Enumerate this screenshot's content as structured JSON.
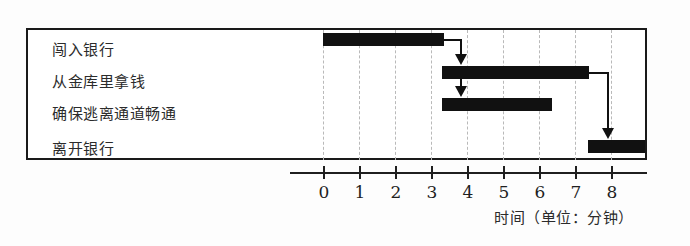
{
  "chart_data": {
    "type": "bar",
    "subtype": "gantt",
    "title": "",
    "xlabel": "时间（单位：分钟）",
    "ylabel": "",
    "xlim": [
      0,
      9
    ],
    "xticks": [
      0,
      1,
      2,
      3,
      4,
      5,
      6,
      7,
      8
    ],
    "xtick_labels": [
      "0",
      "1",
      "2",
      "3",
      "4",
      "5",
      "6",
      "7",
      "8"
    ],
    "grid": true,
    "grid_style": "dashed-vertical",
    "legend": "none",
    "bar_color": "#111111",
    "categories": [
      "闯入银行",
      "从金库里拿钱",
      "确保逃离通道畅通",
      "离开银行"
    ],
    "tasks": [
      {
        "name": "闯入银行",
        "start": 0.0,
        "end": 3.35,
        "duration": 3.35
      },
      {
        "name": "从金库里拿钱",
        "start": 3.3,
        "end": 7.4,
        "duration": 4.1
      },
      {
        "name": "确保逃离通道畅通",
        "start": 3.3,
        "end": 6.35,
        "duration": 3.05
      },
      {
        "name": "离开银行",
        "start": 7.35,
        "end": 8.95,
        "duration": 1.6
      }
    ],
    "dependencies": [
      {
        "from": "闯入银行",
        "to": "从金库里拿钱"
      },
      {
        "from": "闯入银行",
        "to": "确保逃离通道畅通"
      },
      {
        "from": "从金库里拿钱",
        "to": "离开银行"
      }
    ]
  },
  "tasks": {
    "row0": "闯入银行",
    "row1": "从金库里拿钱",
    "row2": "确保逃离通道畅通",
    "row3": "离开银行"
  },
  "axis": {
    "title": "时间（单位：分钟）",
    "ticks": [
      "0",
      "1",
      "2",
      "3",
      "4",
      "5",
      "6",
      "7",
      "8"
    ]
  }
}
